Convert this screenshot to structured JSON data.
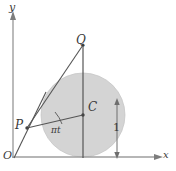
{
  "figure": {
    "background_color": "#ffffff",
    "disk_fill_color": "#d4d4d4",
    "line_color": "#555555",
    "axis_color": "#9a9a9a",
    "label_color": "#3a3a3a"
  },
  "axes": {
    "x_label": "x",
    "y_label": "y",
    "origin_label": "O",
    "x_axis_y": 157,
    "y_axis_x": 13,
    "x_axis_end": 160,
    "y_axis_top": 12
  },
  "circle": {
    "center_x": 83,
    "center_y": 115,
    "radius": 42,
    "center_label": "C",
    "top_point_label": "Q",
    "left_point_label": "P"
  },
  "points": {
    "Q": {
      "label": "Q",
      "x": 83,
      "y": 45
    },
    "C": {
      "label": "C",
      "x": 83,
      "y": 115
    },
    "P": {
      "label": "P",
      "x": 27,
      "y": 128
    },
    "O": {
      "label": "O",
      "x": 13,
      "y": 157
    }
  },
  "annotations": {
    "angle_label": "πt",
    "radius_dimension_label": "1",
    "dimension_arrow_x": 117,
    "dimension_arrow_top": 100,
    "dimension_arrow_bottom": 157
  }
}
